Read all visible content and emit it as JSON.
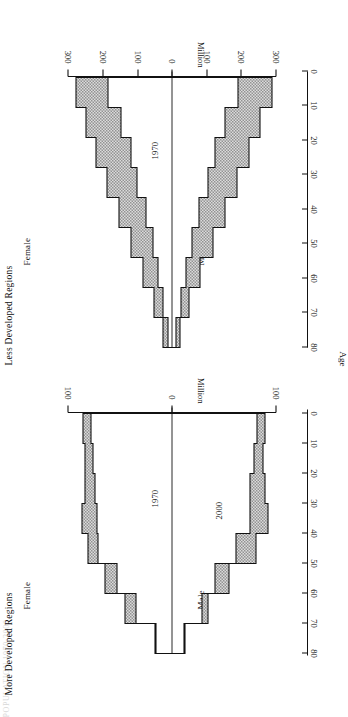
{
  "figure": {
    "header_fragment": "POPULATION  1970-2000",
    "orientation": "landscape-rotated",
    "age_axis": {
      "label": "Age",
      "ticks": [
        80,
        70,
        60,
        50,
        40,
        30,
        20,
        10,
        0
      ]
    }
  },
  "panels": [
    {
      "id": "more-developed",
      "title": "More Developed Regions",
      "male_label": "Male",
      "female_label": "Female",
      "year_inner_label": "1970",
      "year_outer_label": "2000",
      "value_axis": {
        "label": "Million",
        "ticks": [
          100,
          0,
          100
        ],
        "max": 100
      }
    },
    {
      "id": "less-developed",
      "title": "Less Developed Regions",
      "male_label": "Male",
      "female_label": "Female",
      "year_inner_label": "1970",
      "year_outer_label": "2000",
      "value_axis": {
        "label": "Million",
        "ticks": [
          300,
          200,
          100,
          0,
          100,
          200,
          300
        ],
        "max": 300
      }
    }
  ],
  "chart_data": {
    "type": "area",
    "xlabel": "Age",
    "ylabel": "Million",
    "grid": false,
    "legend": [
      "1970",
      "2000"
    ],
    "age_groups": [
      0,
      10,
      20,
      30,
      40,
      50,
      60,
      70,
      80
    ],
    "panels": [
      {
        "name": "More Developed Regions",
        "ylim": [
          -100,
          100
        ],
        "series": [
          {
            "name": "1970 Male",
            "values": [
              58,
              57,
              54,
              43,
              44,
              42,
              32,
              20,
              8
            ]
          },
          {
            "name": "1970 Female",
            "values": [
              56,
              55,
              53,
              43,
              45,
              45,
              37,
              27,
              13
            ]
          },
          {
            "name": "2000 Male",
            "values": [
              62,
              61,
              60,
              62,
              56,
              47,
              38,
              25,
              11
            ]
          },
          {
            "name": "2000 Female",
            "values": [
              59,
              58,
              58,
              60,
              56,
              49,
              43,
              33,
              19
            ]
          }
        ]
      },
      {
        "name": "Less Developed Regions",
        "ylim": [
          -300,
          300
        ],
        "series": [
          {
            "name": "1970 Male",
            "values": [
              200,
              160,
              128,
              100,
              78,
              58,
              40,
              24,
              10
            ]
          },
          {
            "name": "1970 Female",
            "values": [
              192,
              155,
              124,
              97,
              76,
              57,
              41,
              25,
              11
            ]
          },
          {
            "name": "2000 Male",
            "values": [
              300,
              268,
              236,
              200,
              162,
              124,
              88,
              52,
              22
            ]
          },
          {
            "name": "2000 Female",
            "values": [
              288,
              258,
              228,
              194,
              158,
              122,
              88,
              54,
              25
            ]
          }
        ]
      }
    ]
  }
}
